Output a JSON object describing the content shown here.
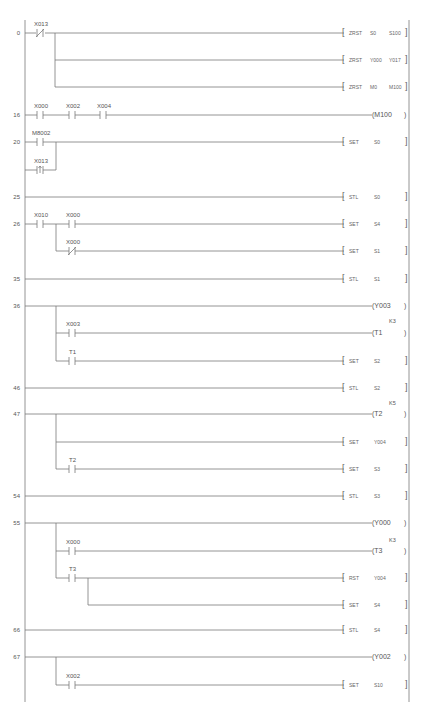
{
  "diagram": {
    "type": "ladder-logic",
    "colors": {
      "line": "#7a7a7a",
      "text": "#555555",
      "background": "#ffffff"
    },
    "rungs": [
      {
        "step": "0",
        "contacts": [
          {
            "label": "X013",
            "type": "normally-closed"
          }
        ],
        "outputs": [
          {
            "kind": "instruction",
            "op": "ZRST",
            "arg1": "S0",
            "arg2": "S100"
          },
          {
            "kind": "instruction",
            "op": "ZRST",
            "arg1": "Y000",
            "arg2": "Y017"
          },
          {
            "kind": "instruction",
            "op": "ZRST",
            "arg1": "M0",
            "arg2": "M100"
          }
        ]
      },
      {
        "step": "16",
        "contacts": [
          {
            "label": "X000",
            "type": "normally-open"
          },
          {
            "label": "X002",
            "type": "normally-open"
          },
          {
            "label": "X004",
            "type": "normally-open"
          }
        ],
        "outputs": [
          {
            "kind": "coil",
            "name": "M100"
          }
        ]
      },
      {
        "step": "20",
        "contacts": [
          {
            "label": "M8002",
            "type": "normally-open"
          },
          {
            "label": "X013",
            "type": "pulse-rising",
            "parallel": true
          }
        ],
        "outputs": [
          {
            "kind": "instruction",
            "op": "SET",
            "arg1": "S0"
          }
        ]
      },
      {
        "step": "25",
        "outputs": [
          {
            "kind": "instruction",
            "op": "STL",
            "arg1": "S0"
          }
        ]
      },
      {
        "step": "26",
        "contacts": [
          {
            "label": "X010",
            "type": "normally-open"
          },
          {
            "label": "X000",
            "type": "normally-open"
          },
          {
            "label": "X000",
            "type": "normally-closed",
            "branch": true
          }
        ],
        "outputs": [
          {
            "kind": "instruction",
            "op": "SET",
            "arg1": "S4"
          },
          {
            "kind": "instruction",
            "op": "SET",
            "arg1": "S1"
          }
        ]
      },
      {
        "step": "35",
        "outputs": [
          {
            "kind": "instruction",
            "op": "STL",
            "arg1": "S1"
          }
        ]
      },
      {
        "step": "36",
        "contacts": [
          {
            "label": "X003",
            "type": "normally-open",
            "branch": true
          },
          {
            "label": "T1",
            "type": "normally-open",
            "branch": true
          }
        ],
        "outputs": [
          {
            "kind": "coil",
            "name": "Y003"
          },
          {
            "kind": "coil",
            "name": "T1",
            "k": "K3"
          },
          {
            "kind": "instruction",
            "op": "SET",
            "arg1": "S2"
          }
        ]
      },
      {
        "step": "46",
        "outputs": [
          {
            "kind": "instruction",
            "op": "STL",
            "arg1": "S2"
          }
        ]
      },
      {
        "step": "47",
        "contacts": [
          {
            "label": "T2",
            "type": "normally-open",
            "branch": true
          }
        ],
        "outputs": [
          {
            "kind": "coil",
            "name": "T2",
            "k": "K5"
          },
          {
            "kind": "instruction",
            "op": "SET",
            "arg1": "Y004"
          },
          {
            "kind": "instruction",
            "op": "SET",
            "arg1": "S3"
          }
        ]
      },
      {
        "step": "54",
        "outputs": [
          {
            "kind": "instruction",
            "op": "STL",
            "arg1": "S3"
          }
        ]
      },
      {
        "step": "55",
        "contacts": [
          {
            "label": "X000",
            "type": "normally-open",
            "branch": true
          },
          {
            "label": "T3",
            "type": "normally-open",
            "branch": true
          }
        ],
        "outputs": [
          {
            "kind": "coil",
            "name": "Y000"
          },
          {
            "kind": "coil",
            "name": "T3",
            "k": "K3"
          },
          {
            "kind": "instruction",
            "op": "RST",
            "arg1": "Y004"
          },
          {
            "kind": "instruction",
            "op": "SET",
            "arg1": "S4"
          }
        ]
      },
      {
        "step": "66",
        "outputs": [
          {
            "kind": "instruction",
            "op": "STL",
            "arg1": "S4"
          }
        ]
      },
      {
        "step": "67",
        "contacts": [
          {
            "label": "X002",
            "type": "normally-open",
            "branch": true
          }
        ],
        "outputs": [
          {
            "kind": "coil",
            "name": "Y002"
          },
          {
            "kind": "instruction",
            "op": "SET",
            "arg1": "S10"
          }
        ]
      }
    ]
  },
  "labels": {
    "steps": [
      "0",
      "16",
      "20",
      "25",
      "26",
      "35",
      "36",
      "46",
      "47",
      "54",
      "55",
      "66",
      "67"
    ],
    "r0": {
      "c1": "X013",
      "i1": [
        "ZRST",
        "S0",
        "S100"
      ],
      "i2": [
        "ZRST",
        "Y000",
        "Y017"
      ],
      "i3": [
        "ZRST",
        "M0",
        "M100"
      ]
    },
    "r16": {
      "c1": "X000",
      "c2": "X002",
      "c3": "X004",
      "coil": "M100"
    },
    "r20": {
      "c1": "M8002",
      "c2": "X013",
      "i1": [
        "SET",
        "S0"
      ]
    },
    "r25": {
      "i1": [
        "STL",
        "S0"
      ]
    },
    "r26": {
      "c1": "X010",
      "c2": "X000",
      "c3": "X000",
      "i1": [
        "SET",
        "S4"
      ],
      "i2": [
        "SET",
        "S1"
      ]
    },
    "r35": {
      "i1": [
        "STL",
        "S1"
      ]
    },
    "r36": {
      "coil1": "Y003",
      "c1": "X003",
      "coil2": "T1",
      "k2": "K3",
      "c2": "T1",
      "i1": [
        "SET",
        "S2"
      ]
    },
    "r46": {
      "i1": [
        "STL",
        "S2"
      ]
    },
    "r47": {
      "coil1": "T2",
      "k1": "K5",
      "i1": [
        "SET",
        "Y004"
      ],
      "c1": "T2",
      "i2": [
        "SET",
        "S3"
      ]
    },
    "r54": {
      "i1": [
        "STL",
        "S3"
      ]
    },
    "r55": {
      "coil1": "Y000",
      "c1": "X000",
      "coil2": "T3",
      "k2": "K3",
      "c2": "T3",
      "i1": [
        "RST",
        "Y004"
      ],
      "i2": [
        "SET",
        "S4"
      ]
    },
    "r66": {
      "i1": [
        "STL",
        "S4"
      ]
    },
    "r67": {
      "coil1": "Y002",
      "c1": "X002",
      "i1": [
        "SET",
        "S10"
      ]
    }
  }
}
